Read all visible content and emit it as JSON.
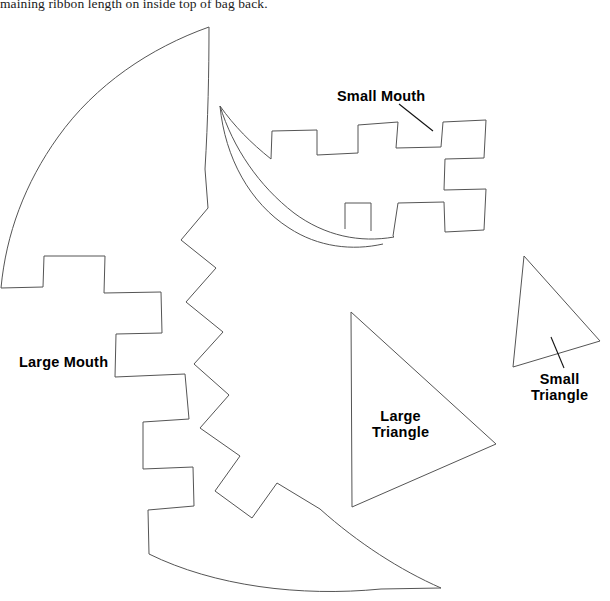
{
  "page": {
    "background_color": "#ffffff",
    "outline_color": "#555555",
    "label_color": "#000000",
    "width": 610,
    "height": 601
  },
  "instruction": {
    "text": "maining ribbon length on inside top of bag back.",
    "note": "clipped at top edge of page"
  },
  "labels": {
    "small_mouth": "Small Mouth",
    "large_mouth": "Large Mouth",
    "large_triangle_line1": "Large",
    "large_triangle_line2": "Triangle",
    "small_triangle_line1": "Small",
    "small_triangle_line2": "Triangle"
  },
  "shapes": [
    {
      "name": "large-mouth",
      "label": "Large Mouth",
      "type": "crescent-with-zigzag-teeth",
      "has_leader_line": false
    },
    {
      "name": "small-mouth",
      "label": "Small Mouth",
      "type": "crescent-with-square-teeth",
      "has_leader_line": true
    },
    {
      "name": "large-triangle",
      "label": "Large Triangle",
      "type": "triangle",
      "has_leader_line": false
    },
    {
      "name": "small-triangle",
      "label": "Small Triangle",
      "type": "triangle",
      "has_leader_line": true
    }
  ]
}
